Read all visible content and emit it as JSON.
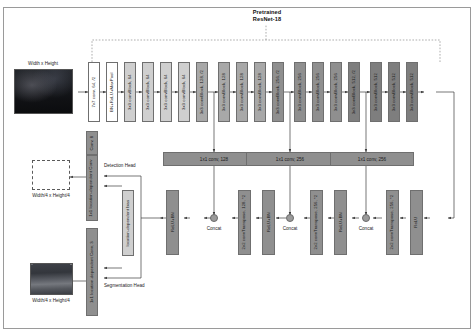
{
  "figure": {
    "title": "Pretrained\nResNet-18",
    "title_line1": "Pretrained",
    "title_line2": "ResNet-18"
  },
  "inputs": {
    "image_label": "Width x Height",
    "image_name": "road-scene-input-image"
  },
  "outputs": {
    "detection_label": "Width/4 x Height/4",
    "segmentation_label": "Width/4 x Height/4",
    "detection_head_label": "Detection Head",
    "segmentation_head_label": "Segmentation Head"
  },
  "encoder": {
    "stem": [
      {
        "label": "7x7 conv, 64, /2",
        "style": "v-white"
      },
      {
        "label": "BN+ReLU+MaxPool",
        "style": "v-white"
      }
    ],
    "stage1": [
      {
        "label": "3x3 convBlock, 64",
        "style": "v-lgray"
      },
      {
        "label": "3x3 convBlock, 64",
        "style": "v-lgray"
      },
      {
        "label": "3x3 convBlock, 64",
        "style": "v-lgray"
      },
      {
        "label": "3x3 convBlock, 64",
        "style": "v-lgray"
      }
    ],
    "stage2": [
      {
        "label": "3x3 convBlock, 128, /2",
        "style": "v-mgray"
      },
      {
        "label": "3x3 convBlock, 128",
        "style": "v-mgray"
      },
      {
        "label": "3x3 convBlock, 128",
        "style": "v-mgray"
      },
      {
        "label": "3x3 convBlock, 128",
        "style": "v-mgray"
      }
    ],
    "stage3": [
      {
        "label": "3x3 convBlock, 256, /2",
        "style": "v-dgray"
      },
      {
        "label": "3x3 convBlock, 256",
        "style": "v-dgray"
      },
      {
        "label": "3x3 convBlock, 256",
        "style": "v-dgray"
      },
      {
        "label": "3x3 convBlock, 256",
        "style": "v-dgray"
      }
    ],
    "stage4": [
      {
        "label": "3x3 convBlock, 512, /2",
        "style": "v-ddgray"
      },
      {
        "label": "3x3 convBlock, 512",
        "style": "v-ddgray"
      },
      {
        "label": "3x3 convBlock, 512",
        "style": "v-ddgray"
      },
      {
        "label": "3x3 convBlock, 512",
        "style": "v-ddgray"
      }
    ]
  },
  "skips": [
    {
      "label": "1x1 conv, 128"
    },
    {
      "label": "1x1 conv, 256"
    },
    {
      "label": "1x1 conv, 256"
    }
  ],
  "decoder": {
    "relu1": "ReLU+BN",
    "concat1": "Concat",
    "upconv1": "2x2 convTranspose, 128, *2",
    "relu2": "ReLU+BN",
    "concat2": "Concat",
    "upconv2": "2x2 convTranspose, 256, *2",
    "relu3": "ReLU+BN",
    "concat3": "Concat",
    "upconv3": "2x2 convTranspose, 256, *2",
    "relu4": "ReLU"
  },
  "heads": {
    "conv8": "Conv, 8",
    "detection_conv": "1x1 location-dependent Conv",
    "segmentation_conv": "1x1 location-dependent Conv, 3",
    "bias": "location-dependent bias"
  },
  "colors": {
    "block_border": "#6f6f6f",
    "stem": "#ffffff",
    "stage1": "#cfcfcf",
    "stage2": "#a8a8a8",
    "stage3": "#8f8f8f",
    "stage4": "#7e7e7e",
    "bar": "#8f8f8f",
    "line": "#4a4a4a"
  }
}
